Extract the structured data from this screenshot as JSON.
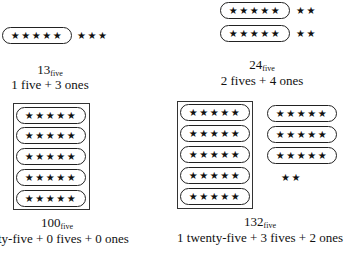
{
  "panels": {
    "p13": {
      "value": "13",
      "base": "five",
      "description": "1 five + 3 ones",
      "groups_of_five": [
        "★★★★★"
      ],
      "ones": "★★★"
    },
    "p24": {
      "value": "24",
      "base": "five",
      "description": "2 fives + 4 ones",
      "groups_of_five": [
        "★★★★★",
        "★★★★★"
      ],
      "ones_rows": [
        "★★",
        "★★"
      ]
    },
    "p100": {
      "value": "100",
      "base": "five",
      "description": "ty-five + 0 fives + 0 ones",
      "twenty_five_block": [
        "★★★★★",
        "★★★★★",
        "★★★★★",
        "★★★★★",
        "★★★★★"
      ]
    },
    "p132": {
      "value": "132",
      "base": "five",
      "description": "1 twenty-five + 3 fives + 2 ones",
      "twenty_five_block": [
        "★★★★★",
        "★★★★★",
        "★★★★★",
        "★★★★★",
        "★★★★★"
      ],
      "groups_of_five": [
        "★★★★★",
        "★★★★★",
        "★★★★★"
      ],
      "ones": "★★"
    }
  }
}
